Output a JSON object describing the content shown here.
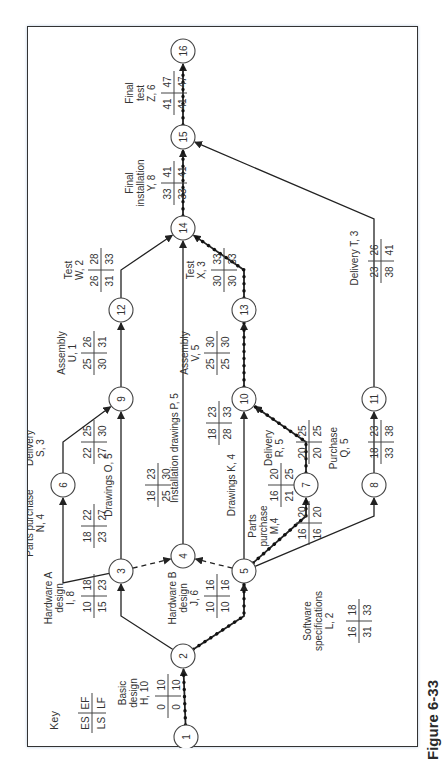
{
  "figure_label": "Figure 6-33",
  "key": {
    "title": "Key",
    "es": "ES",
    "ef": "EF",
    "ls": "LS",
    "lf": "LF"
  },
  "nodes": [
    {
      "id": "1",
      "u": 11,
      "v": 158
    },
    {
      "id": "2",
      "u": 92,
      "v": 155
    },
    {
      "id": "3",
      "u": 177,
      "v": 93
    },
    {
      "id": "4",
      "u": 192,
      "v": 155
    },
    {
      "id": "5",
      "u": 177,
      "v": 216
    },
    {
      "id": "6",
      "u": 263,
      "v": 35
    },
    {
      "id": "7",
      "u": 263,
      "v": 278
    },
    {
      "id": "8",
      "u": 263,
      "v": 346
    },
    {
      "id": "9",
      "u": 349,
      "v": 93
    },
    {
      "id": "10",
      "u": 349,
      "v": 216
    },
    {
      "id": "11",
      "u": 349,
      "v": 346
    },
    {
      "id": "12",
      "u": 438,
      "v": 93
    },
    {
      "id": "13",
      "u": 438,
      "v": 216
    },
    {
      "id": "14",
      "u": 520,
      "v": 155
    },
    {
      "id": "15",
      "u": 611,
      "v": 155
    },
    {
      "id": "16",
      "u": 697,
      "v": 155
    }
  ],
  "activities": [
    {
      "from": "1",
      "to": "2",
      "label": [
        "Basic",
        "design",
        "H, 10"
      ],
      "es": 0,
      "ef": 10,
      "ls": 0,
      "lf": 10,
      "critical": true
    },
    {
      "from": "2",
      "to": "3",
      "label": [
        "Hardware  A",
        "design",
        "I, 8"
      ],
      "es": 10,
      "ef": 18,
      "ls": 15,
      "lf": 23,
      "critical": false
    },
    {
      "from": "2",
      "to": "5",
      "label": [
        "Hardware  B",
        "design",
        "J, 6"
      ],
      "es": 10,
      "ef": 16,
      "ls": 10,
      "lf": 16,
      "critical": true
    },
    {
      "from": "3",
      "to": "6",
      "label": [
        "Parts purchase",
        "N, 4"
      ],
      "es": 18,
      "ef": 22,
      "ls": 23,
      "lf": 27,
      "critical": false
    },
    {
      "from": "3",
      "to": "9",
      "label": [
        "Drawings O, 5"
      ],
      "es": 18,
      "ef": 23,
      "ls": 25,
      "lf": 30,
      "critical": false
    },
    {
      "from": "3",
      "to": "4",
      "label": [],
      "dummy": true
    },
    {
      "from": "5",
      "to": "4",
      "label": [],
      "dummy": true
    },
    {
      "from": "4",
      "to": "14",
      "label": [
        "Installation drawings P, 5"
      ],
      "es": 18,
      "ef": 23,
      "ls": 28,
      "lf": 33,
      "critical": false
    },
    {
      "from": "5",
      "to": "10",
      "label": [
        "Drawings K, 4"
      ],
      "es": 16,
      "ef": 20,
      "ls": 21,
      "lf": 25,
      "critical": false
    },
    {
      "from": "5",
      "to": "7",
      "label": [
        "Parts",
        "purchase",
        "M,4"
      ],
      "es": 16,
      "ef": 20,
      "ls": 16,
      "lf": 20,
      "critical": true
    },
    {
      "from": "5",
      "to": "8",
      "label": [
        "Software",
        "specifications",
        "L, 2"
      ],
      "es": 16,
      "ef": 18,
      "ls": 31,
      "lf": 33,
      "critical": false
    },
    {
      "from": "6",
      "to": "9",
      "label": [
        "Delivery",
        "S, 3"
      ],
      "es": 22,
      "ef": 25,
      "ls": 27,
      "lf": 30,
      "critical": false
    },
    {
      "from": "7",
      "to": "10",
      "label": [
        "Delivery",
        "R, 5"
      ],
      "es": 20,
      "ef": 25,
      "ls": 20,
      "lf": 25,
      "critical": true
    },
    {
      "from": "8",
      "to": "11",
      "label": [
        "Purchase",
        "Q, 5"
      ],
      "es": 18,
      "ef": 23,
      "ls": 33,
      "lf": 38,
      "critical": false
    },
    {
      "from": "9",
      "to": "12",
      "label": [
        "Assembly",
        "U, 1"
      ],
      "es": 25,
      "ef": 26,
      "ls": 30,
      "lf": 31,
      "critical": false
    },
    {
      "from": "10",
      "to": "13",
      "label": [
        "Assembly",
        "V, 5"
      ],
      "es": 25,
      "ef": 30,
      "ls": 25,
      "lf": 30,
      "critical": true
    },
    {
      "from": "11",
      "to": "15",
      "label": [
        "Delivery T, 3"
      ],
      "es": 23,
      "ef": 26,
      "ls": 38,
      "lf": 41,
      "critical": false
    },
    {
      "from": "12",
      "to": "14",
      "label": [
        "Test",
        "W, 2"
      ],
      "es": 26,
      "ef": 28,
      "ls": 31,
      "lf": 33,
      "critical": false
    },
    {
      "from": "13",
      "to": "14",
      "label": [
        "Test",
        "X, 3"
      ],
      "es": 30,
      "ef": 33,
      "ls": 30,
      "lf": 33,
      "critical": true
    },
    {
      "from": "14",
      "to": "15",
      "label": [
        "Final",
        "installation",
        "Y, 8"
      ],
      "es": 33,
      "ef": 41,
      "ls": 33,
      "lf": 41,
      "critical": true
    },
    {
      "from": "15",
      "to": "16",
      "label": [
        "Final",
        "test",
        "Z, 6"
      ],
      "es": 41,
      "ef": 47,
      "ls": 41,
      "lf": 47,
      "critical": true
    }
  ]
}
